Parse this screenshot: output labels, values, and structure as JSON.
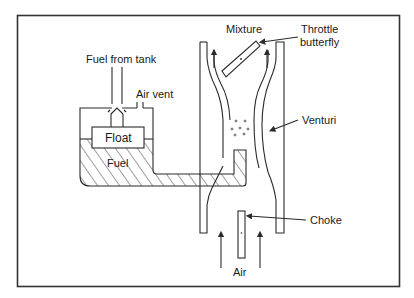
{
  "diagram": {
    "labels": {
      "fuel_from_tank": "Fuel from tank",
      "air_vent": "Air vent",
      "float": "Float",
      "fuel": "Fuel",
      "mixture": "Mixture",
      "throttle_line1": "Throttle",
      "throttle_line2": "butterfly",
      "venturi": "Venturi",
      "choke": "Choke",
      "air": "Air"
    },
    "colors": {
      "line": "#2a2a2a",
      "background": "#ffffff",
      "frame": "#333333"
    }
  }
}
